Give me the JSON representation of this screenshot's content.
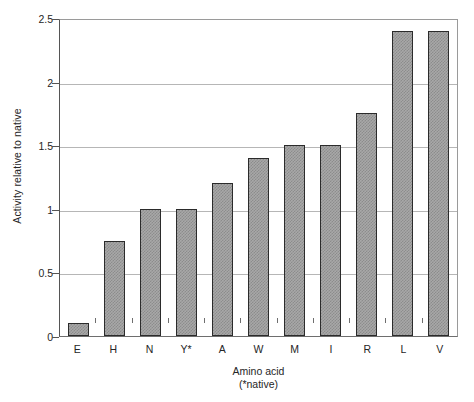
{
  "chart_data": {
    "type": "bar",
    "title": "",
    "subtitle": "",
    "categories": [
      "E",
      "H",
      "N",
      "Y*",
      "A",
      "W",
      "M",
      "I",
      "R",
      "L",
      "V"
    ],
    "values": [
      0.1,
      0.75,
      1.0,
      1.0,
      1.2,
      1.4,
      1.5,
      1.5,
      1.75,
      2.4,
      2.4
    ],
    "xlabel": "Amino acid",
    "xlabel_line2": "(*native)",
    "ylabel": "Activity relative to native",
    "ylim": [
      0,
      2.5
    ],
    "ytick_labels": [
      "2.5",
      "2",
      "1.5",
      "1",
      "0.5",
      "0"
    ],
    "ytick_values": [
      2.5,
      2.0,
      1.5,
      1.0,
      0.5,
      0
    ],
    "grid": true,
    "legend": false,
    "legend_position": "none",
    "bar_fill_color": "#a8a8a8",
    "bar_border_color": "#2b2b2b",
    "gridline_color": "#b6b6b6",
    "axis_color": "#555555",
    "background_color": "#ffffff"
  }
}
